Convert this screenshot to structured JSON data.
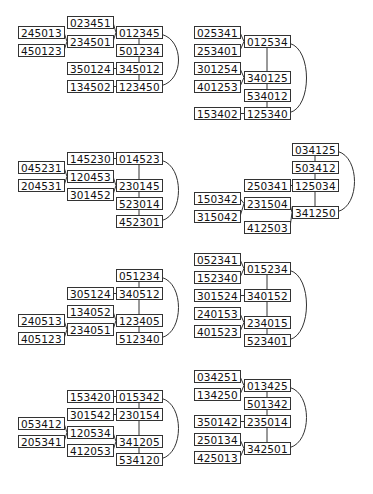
{
  "diagrams": [
    {
      "id": "d1",
      "nodes": [
        {
          "label": "023451",
          "x": 67,
          "y": 16
        },
        {
          "label": "012345",
          "x": 116,
          "y": 26
        },
        {
          "label": "245013",
          "x": 18,
          "y": 26
        },
        {
          "label": "234501",
          "x": 67,
          "y": 35
        },
        {
          "label": "450123",
          "x": 18,
          "y": 44
        },
        {
          "label": "501234",
          "x": 116,
          "y": 44
        },
        {
          "label": "350124",
          "x": 67,
          "y": 62
        },
        {
          "label": "345012",
          "x": 116,
          "y": 62
        },
        {
          "label": "134502",
          "x": 67,
          "y": 80
        },
        {
          "label": "123450",
          "x": 116,
          "y": 80
        }
      ],
      "edges": [
        [
          0,
          1
        ],
        [
          2,
          3
        ],
        [
          4,
          3
        ],
        [
          3,
          1
        ],
        [
          1,
          5
        ],
        [
          5,
          7
        ],
        [
          6,
          7
        ],
        [
          7,
          9
        ],
        [
          8,
          9
        ]
      ],
      "arc": [
        1,
        9
      ]
    },
    {
      "id": "d2",
      "nodes": [
        {
          "label": "025341",
          "x": 194,
          "y": 26
        },
        {
          "label": "012534",
          "x": 244,
          "y": 35
        },
        {
          "label": "253401",
          "x": 194,
          "y": 44
        },
        {
          "label": "301254",
          "x": 194,
          "y": 62
        },
        {
          "label": "340125",
          "x": 244,
          "y": 71
        },
        {
          "label": "401253",
          "x": 194,
          "y": 80
        },
        {
          "label": "534012",
          "x": 244,
          "y": 89
        },
        {
          "label": "153402",
          "x": 194,
          "y": 107
        },
        {
          "label": "125340",
          "x": 244,
          "y": 107
        }
      ],
      "edges": [
        [
          0,
          1
        ],
        [
          2,
          1
        ],
        [
          1,
          4
        ],
        [
          3,
          4
        ],
        [
          5,
          4
        ],
        [
          4,
          6
        ],
        [
          6,
          8
        ],
        [
          7,
          8
        ]
      ],
      "arc": [
        1,
        8
      ]
    },
    {
      "id": "d3",
      "nodes": [
        {
          "label": "145230",
          "x": 67,
          "y": 152
        },
        {
          "label": "014523",
          "x": 116,
          "y": 152
        },
        {
          "label": "045231",
          "x": 18,
          "y": 161
        },
        {
          "label": "120453",
          "x": 67,
          "y": 170
        },
        {
          "label": "204531",
          "x": 18,
          "y": 179
        },
        {
          "label": "230145",
          "x": 116,
          "y": 179
        },
        {
          "label": "301452",
          "x": 67,
          "y": 188
        },
        {
          "label": "523014",
          "x": 116,
          "y": 197
        },
        {
          "label": "452301",
          "x": 116,
          "y": 215
        }
      ],
      "edges": [
        [
          0,
          1
        ],
        [
          2,
          3
        ],
        [
          4,
          3
        ],
        [
          3,
          5
        ],
        [
          6,
          5
        ],
        [
          1,
          5
        ],
        [
          5,
          7
        ],
        [
          7,
          8
        ]
      ],
      "arc": [
        1,
        8
      ]
    },
    {
      "id": "d4",
      "nodes": [
        {
          "label": "034125",
          "x": 292,
          "y": 143
        },
        {
          "label": "503412",
          "x": 292,
          "y": 161
        },
        {
          "label": "250341",
          "x": 244,
          "y": 179
        },
        {
          "label": "125034",
          "x": 292,
          "y": 179
        },
        {
          "label": "150342",
          "x": 194,
          "y": 192
        },
        {
          "label": "231504",
          "x": 244,
          "y": 197
        },
        {
          "label": "315042",
          "x": 194,
          "y": 210
        },
        {
          "label": "341250",
          "x": 292,
          "y": 206
        },
        {
          "label": "412503",
          "x": 244,
          "y": 221
        }
      ],
      "edges": [
        [
          0,
          1
        ],
        [
          1,
          3
        ],
        [
          2,
          3
        ],
        [
          4,
          5
        ],
        [
          6,
          5
        ],
        [
          5,
          7
        ],
        [
          8,
          7
        ],
        [
          3,
          7
        ]
      ],
      "arc": [
        0,
        7
      ]
    },
    {
      "id": "d5",
      "nodes": [
        {
          "label": "051234",
          "x": 116,
          "y": 269
        },
        {
          "label": "305124",
          "x": 67,
          "y": 287
        },
        {
          "label": "340512",
          "x": 116,
          "y": 287
        },
        {
          "label": "134052",
          "x": 67,
          "y": 305
        },
        {
          "label": "240513",
          "x": 18,
          "y": 314
        },
        {
          "label": "123405",
          "x": 116,
          "y": 314
        },
        {
          "label": "234051",
          "x": 67,
          "y": 323
        },
        {
          "label": "405123",
          "x": 18,
          "y": 332
        },
        {
          "label": "512340",
          "x": 116,
          "y": 332
        }
      ],
      "edges": [
        [
          0,
          2
        ],
        [
          1,
          2
        ],
        [
          2,
          5
        ],
        [
          3,
          5
        ],
        [
          4,
          6
        ],
        [
          7,
          6
        ],
        [
          6,
          5
        ],
        [
          5,
          8
        ]
      ],
      "arc": [
        0,
        8
      ]
    },
    {
      "id": "d6",
      "nodes": [
        {
          "label": "052341",
          "x": 194,
          "y": 253
        },
        {
          "label": "015234",
          "x": 244,
          "y": 262
        },
        {
          "label": "152340",
          "x": 194,
          "y": 271
        },
        {
          "label": "301524",
          "x": 194,
          "y": 289
        },
        {
          "label": "340152",
          "x": 244,
          "y": 289
        },
        {
          "label": "240153",
          "x": 194,
          "y": 307
        },
        {
          "label": "234015",
          "x": 244,
          "y": 316
        },
        {
          "label": "401523",
          "x": 194,
          "y": 325
        },
        {
          "label": "523401",
          "x": 244,
          "y": 334
        }
      ],
      "edges": [
        [
          0,
          1
        ],
        [
          2,
          1
        ],
        [
          1,
          4
        ],
        [
          3,
          4
        ],
        [
          4,
          6
        ],
        [
          5,
          6
        ],
        [
          7,
          6
        ],
        [
          6,
          8
        ]
      ],
      "arc": [
        1,
        8
      ]
    },
    {
      "id": "d7",
      "nodes": [
        {
          "label": "153420",
          "x": 67,
          "y": 390
        },
        {
          "label": "015342",
          "x": 116,
          "y": 390
        },
        {
          "label": "301542",
          "x": 67,
          "y": 408
        },
        {
          "label": "230154",
          "x": 116,
          "y": 408
        },
        {
          "label": "053412",
          "x": 18,
          "y": 417
        },
        {
          "label": "120534",
          "x": 67,
          "y": 426
        },
        {
          "label": "205341",
          "x": 18,
          "y": 435
        },
        {
          "label": "341205",
          "x": 116,
          "y": 435
        },
        {
          "label": "412053",
          "x": 67,
          "y": 444
        },
        {
          "label": "534120",
          "x": 116,
          "y": 453
        }
      ],
      "edges": [
        [
          0,
          1
        ],
        [
          2,
          3
        ],
        [
          1,
          3
        ],
        [
          3,
          7
        ],
        [
          4,
          5
        ],
        [
          6,
          5
        ],
        [
          5,
          7
        ],
        [
          8,
          7
        ],
        [
          7,
          9
        ]
      ],
      "arc": [
        1,
        9
      ]
    },
    {
      "id": "d8",
      "nodes": [
        {
          "label": "034251",
          "x": 194,
          "y": 370
        },
        {
          "label": "013425",
          "x": 244,
          "y": 379
        },
        {
          "label": "134250",
          "x": 194,
          "y": 388
        },
        {
          "label": "501342",
          "x": 244,
          "y": 397
        },
        {
          "label": "350142",
          "x": 194,
          "y": 415
        },
        {
          "label": "235014",
          "x": 244,
          "y": 415
        },
        {
          "label": "250134",
          "x": 194,
          "y": 433
        },
        {
          "label": "342501",
          "x": 244,
          "y": 442
        },
        {
          "label": "425013",
          "x": 194,
          "y": 451
        }
      ],
      "edges": [
        [
          0,
          1
        ],
        [
          2,
          1
        ],
        [
          1,
          3
        ],
        [
          3,
          5
        ],
        [
          4,
          5
        ],
        [
          5,
          7
        ],
        [
          6,
          7
        ],
        [
          8,
          7
        ]
      ],
      "arc": [
        1,
        7
      ]
    }
  ],
  "style": {
    "line_color": "#333333",
    "box_border": "#333333",
    "text_color": "#111111",
    "background": "#ffffff"
  }
}
